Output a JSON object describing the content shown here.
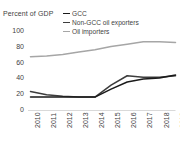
{
  "chart_data": {
    "type": "line",
    "title": "",
    "ylabel": "Percent of GDP",
    "xlabel": "",
    "ylim": [
      0,
      100
    ],
    "yticks": [
      0,
      20,
      40,
      60,
      80,
      100
    ],
    "grid": false,
    "legend_position": "top-right",
    "categories": [
      "2010",
      "2011",
      "2012",
      "2013",
      "2014",
      "2015",
      "2016",
      "2017",
      "2018",
      "2019"
    ],
    "x": [
      2010,
      2011,
      2012,
      2013,
      2014,
      2015,
      2016,
      2017,
      2018,
      2019
    ],
    "series": [
      {
        "name": "GCC",
        "color": "#1a1a1a",
        "values": [
          17,
          17,
          17,
          17,
          17,
          27,
          36,
          40,
          41,
          45
        ]
      },
      {
        "name": "Non-GCC oil exporters",
        "color": "#3d3d3d",
        "values": [
          24,
          20,
          18,
          17,
          17,
          32,
          44,
          42,
          42,
          44
        ]
      },
      {
        "name": "Oil importers",
        "color": "#a6a6a6",
        "values": [
          68,
          69,
          71,
          74,
          77,
          81,
          84,
          87,
          87,
          86
        ]
      }
    ]
  },
  "legend": {
    "items": [
      {
        "label": "GCC",
        "color": "#1a1a1a"
      },
      {
        "label": "Non-GCC oil exporters",
        "color": "#3d3d3d"
      },
      {
        "label": "Oil importers",
        "color": "#a6a6a6"
      }
    ]
  },
  "axes": {
    "y_axis_title": "Percent of GDP",
    "y_tick_labels": [
      "100",
      "80",
      "60",
      "40",
      "20",
      "0"
    ],
    "x_tick_labels": [
      "2010",
      "2011",
      "2012",
      "2013",
      "2014",
      "2015",
      "2016",
      "2017",
      "2018",
      "2019"
    ],
    "axis_line_color": "#d9d9d9"
  }
}
